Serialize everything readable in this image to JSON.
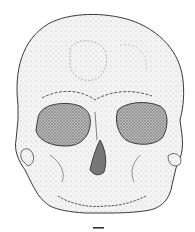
{
  "figure": {
    "style": "stipple",
    "scale_bar": {
      "label": ""
    },
    "colors": {
      "ink": "#3a3a3a",
      "fill": "#f2f2f2",
      "orbit": "#8a8a8a",
      "background": "#ffffff"
    }
  }
}
